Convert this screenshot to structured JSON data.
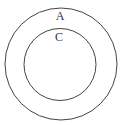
{
  "diagram": {
    "type": "venn-nested",
    "sets": [
      {
        "id": "outer",
        "label": "A"
      },
      {
        "id": "inner",
        "label": "C"
      }
    ],
    "relation": "C is a subset of A",
    "stroke_color": "#444444",
    "background": "#ffffff"
  }
}
